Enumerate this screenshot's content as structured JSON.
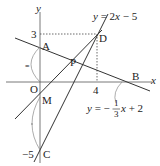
{
  "labels": {
    "y_axis": "y",
    "x_axis": "x",
    "origin": "O",
    "tick_y3": "3",
    "tick_x4": "4",
    "tick_y_neg5": "−5",
    "point_A": "A",
    "point_B": "B",
    "point_C": "C",
    "point_D": "D",
    "point_P": "P",
    "point_M": "M"
  },
  "equations": {
    "line1_prefix": "y",
    "line1_rest": " = 2",
    "line1_x": "x",
    "line1_tail": " − 5",
    "line2_prefix": "y",
    "line2_rest": " = −",
    "line2_num": "1",
    "line2_den": "3",
    "line2_x": "x",
    "line2_tail": " + 2"
  },
  "tick_marks": {
    "equal_mark_1": "=",
    "equal_mark_2": "="
  }
}
